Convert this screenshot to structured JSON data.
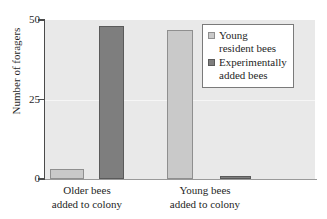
{
  "chart_data": {
    "type": "bar",
    "title": "",
    "xlabel": "",
    "ylabel": "Number of foragers",
    "ylim": [
      0,
      50
    ],
    "yticks": [
      0,
      25,
      50
    ],
    "ytick_labels": [
      "0",
      "25",
      "50"
    ],
    "grid": false,
    "legend_position": "top-right",
    "categories": [
      "Older bees\nadded to colony",
      "Young bees\nadded to colony"
    ],
    "series": [
      {
        "name": "Young\nresident bees",
        "color": "#c9c9c9",
        "values": [
          3,
          47
        ]
      },
      {
        "name": "Experimentally\nadded bees",
        "color": "#7e7e7e",
        "values": [
          48,
          1
        ]
      }
    ]
  },
  "colors": {
    "plot_background": "#e9e9e9",
    "page_background": "#ffffff",
    "axis": "#4a4a4a",
    "baseline": "#9a9a9a",
    "light_bar": "#c9c9c9",
    "dark_bar": "#7e7e7e",
    "legend_border": "#7a7a7a",
    "text": "#1f1f1f"
  }
}
